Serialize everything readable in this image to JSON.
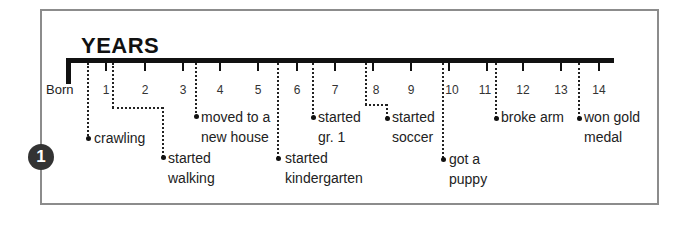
{
  "diagram": {
    "title": "YEARS",
    "start_label": "Born",
    "badge": "1",
    "ticks": [
      "1",
      "2",
      "3",
      "4",
      "5",
      "6",
      "7",
      "8",
      "9",
      "10",
      "11",
      "12",
      "13",
      "14"
    ],
    "events": [
      {
        "label": "crawling",
        "lines": [
          "crawling"
        ]
      },
      {
        "label": "started walking",
        "lines": [
          "started",
          "walking"
        ]
      },
      {
        "label": "moved to a new house",
        "lines": [
          "moved to a",
          "new house"
        ]
      },
      {
        "label": "started kindergarten",
        "lines": [
          "started",
          "kindergarten"
        ]
      },
      {
        "label": "started gr. 1",
        "lines": [
          "started",
          "gr. 1"
        ]
      },
      {
        "label": "started soccer",
        "lines": [
          "started",
          "soccer"
        ]
      },
      {
        "label": "got a puppy",
        "lines": [
          "got a",
          "puppy"
        ]
      },
      {
        "label": "broke arm",
        "lines": [
          "broke arm"
        ]
      },
      {
        "label": "won gold medal",
        "lines": [
          "won gold",
          "medal"
        ]
      }
    ]
  },
  "colors": {
    "line": "#111111",
    "frame": "#8c8c8c",
    "badge": "#333333"
  }
}
